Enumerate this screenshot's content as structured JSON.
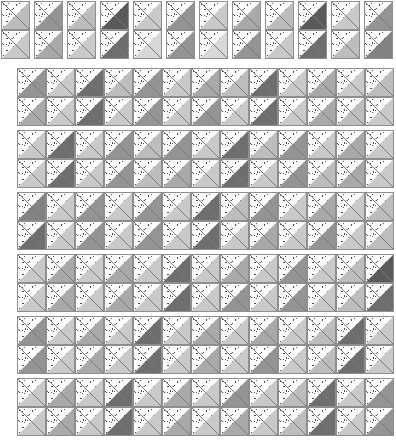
{
  "figure": {
    "canvas": {
      "width": 396,
      "height": 446,
      "background": "#ffffff"
    }
  },
  "palette": {
    "dot_fill": "#fcfcfc",
    "dot_ink": "#4f4f4f",
    "tile_border": "#8e8e8e",
    "diagonal_line": "#7a7a7a",
    "gray_levels": {
      "g1": "#d8d8d8",
      "g2": "#c9c9c9",
      "g3": "#bdbdbd",
      "g4": "#a9a9a9",
      "g5": "#949494",
      "g6": "#828282",
      "g7": "#6e6e6e",
      "g8": "#5a5a5a"
    }
  },
  "geometry": {
    "cell_size": 29,
    "header_tile_count": 12,
    "header_tile_width": 31,
    "header_tile_pitch": 33,
    "header_top": 1,
    "band_left": 17,
    "band_columns": 13,
    "band_rows": 2,
    "band_tops": [
      68,
      130,
      192,
      254,
      316,
      378
    ],
    "band_count": 6
  },
  "header_tiles": [
    {
      "index": 1,
      "x": 1,
      "rows": [
        "g3",
        "g2"
      ]
    },
    {
      "index": 2,
      "x": 34,
      "rows": [
        "g5",
        "g4"
      ]
    },
    {
      "index": 3,
      "x": 67,
      "rows": [
        "g3",
        "g2"
      ]
    },
    {
      "index": 4,
      "x": 100,
      "rows": [
        "g8",
        "g7"
      ]
    },
    {
      "index": 5,
      "x": 133,
      "rows": [
        "g2",
        "g1"
      ]
    },
    {
      "index": 6,
      "x": 166,
      "rows": [
        "g5",
        "g5"
      ]
    },
    {
      "index": 7,
      "x": 199,
      "rows": [
        "g2",
        "g1"
      ]
    },
    {
      "index": 8,
      "x": 232,
      "rows": [
        "g4",
        "g5"
      ]
    },
    {
      "index": 9,
      "x": 265,
      "rows": [
        "g3",
        "g2"
      ]
    },
    {
      "index": 10,
      "x": 298,
      "rows": [
        "g8",
        "g7"
      ]
    },
    {
      "index": 11,
      "x": 331,
      "rows": [
        "g2",
        "g3"
      ]
    },
    {
      "index": 12,
      "x": 364,
      "rows": [
        "g5",
        "g6"
      ]
    }
  ],
  "bands": [
    {
      "index": 1,
      "top": 68,
      "rows": [
        [
          "g5",
          "g2",
          "g7",
          "g3",
          "g5",
          "g2",
          "g4",
          "g3",
          "g7",
          "g2",
          "g4",
          "g2",
          "g3"
        ],
        [
          "g4",
          "g2",
          "g7",
          "g2",
          "g5",
          "g2",
          "g5",
          "g2",
          "g7",
          "g2",
          "g4",
          "g3",
          "g2"
        ]
      ]
    },
    {
      "index": 2,
      "top": 130,
      "rows": [
        [
          "g2",
          "g7",
          "g2",
          "g5",
          "g3",
          "g5",
          "g2",
          "g7",
          "g3",
          "g5",
          "g2",
          "g4",
          "g2"
        ],
        [
          "g2",
          "g7",
          "g2",
          "g5",
          "g3",
          "g4",
          "g2",
          "g7",
          "g2",
          "g5",
          "g3",
          "g4",
          "g2"
        ]
      ]
    },
    {
      "index": 3,
      "top": 192,
      "rows": [
        [
          "g6",
          "g2",
          "g5",
          "g2",
          "g5",
          "g2",
          "g7",
          "g3",
          "g5",
          "g2",
          "g4",
          "g2",
          "g3"
        ],
        [
          "g7",
          "g2",
          "g5",
          "g2",
          "g5",
          "g2",
          "g7",
          "g2",
          "g4",
          "g2",
          "g5",
          "g2",
          "g3"
        ]
      ]
    },
    {
      "index": 4,
      "top": 254,
      "rows": [
        [
          "g2",
          "g4",
          "g2",
          "g4",
          "g2",
          "g7",
          "g2",
          "g4",
          "g2",
          "g5",
          "g2",
          "g3",
          "g8"
        ],
        [
          "g2",
          "g4",
          "g2",
          "g4",
          "g2",
          "g7",
          "g2",
          "g5",
          "g2",
          "g5",
          "g2",
          "g3",
          "g7"
        ]
      ]
    },
    {
      "index": 5,
      "top": 316,
      "rows": [
        [
          "g5",
          "g2",
          "g4",
          "g2",
          "g7",
          "g2",
          "g4",
          "g2",
          "g4",
          "g2",
          "g3",
          "g7",
          "g2"
        ],
        [
          "g5",
          "g2",
          "g4",
          "g2",
          "g7",
          "g2",
          "g4",
          "g2",
          "g5",
          "g2",
          "g3",
          "g7",
          "g2"
        ]
      ]
    },
    {
      "index": 6,
      "top": 378,
      "rows": [
        [
          "g2",
          "g4",
          "g2",
          "g7",
          "g2",
          "g4",
          "g2",
          "g5",
          "g2",
          "g3",
          "g7",
          "g2",
          "g5"
        ],
        [
          "g2",
          "g4",
          "g2",
          "g7",
          "g2",
          "g4",
          "g2",
          "g4",
          "g2",
          "g3",
          "g7",
          "g2",
          "g5"
        ]
      ]
    }
  ]
}
